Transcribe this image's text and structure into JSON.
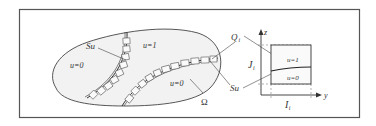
{
  "diagram": {
    "colors": {
      "frame": "#555555",
      "region_fill": "#f2f2f2",
      "stroke": "#444444",
      "background": "#ffffff"
    },
    "labels": {
      "su_left": "Su",
      "u1_main": "u=1",
      "u0_left": "u=0",
      "u0_right": "u=0",
      "omega": "Ω",
      "q_i": "Q",
      "q_i_sub": "i",
      "su_right": "Su",
      "j_i": "J",
      "j_i_sub": "i",
      "i_i": "I",
      "i_i_sub": "i",
      "axis_z": "z",
      "axis_y": "y",
      "box_u1": "u=1",
      "box_u0": "u=0"
    }
  }
}
